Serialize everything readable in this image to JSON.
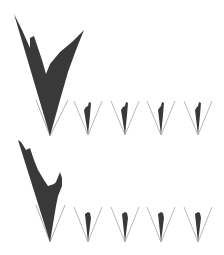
{
  "figure": {
    "background": "#ffffff",
    "fill_color": "#2e2e2e",
    "guide_color": "#9a9a9a",
    "rows": [
      {
        "name": "row-1",
        "large_wedge": {
          "apex": [
            50,
            136
          ],
          "guides": [
            [
              36,
              100
            ],
            [
              68,
              100
            ]
          ],
          "shape": "M50,136 L14,14 L22,30 L30,48 L30,38 L34,36 L42,60 L46,74 L50,64 L60,52 L72,42 L84,30 L76,50 L68,72 L60,100 Z"
        },
        "small_wedges": [
          {
            "apex": [
              88,
              135
            ],
            "guides": [
              [
                74,
                101
              ],
              [
                102,
                101
              ]
            ],
            "shape": "M88,135 L84,110 L86,107 L88,106 L89,102 L91,103 L90,115 Z"
          },
          {
            "apex": [
              125,
              135
            ],
            "guides": [
              [
                111,
                101
              ],
              [
                139,
                101
              ]
            ],
            "shape": "M125,135 L121,110 L123,107 L125,106 L126,102 L128,103 L127,115 Z"
          },
          {
            "apex": [
              161,
              135
            ],
            "guides": [
              [
                147,
                101
              ],
              [
                175,
                101
              ]
            ],
            "shape": "M161,135 L158,110 L160,107 L161,106 L162,102 L164,103 L163,115 Z"
          },
          {
            "apex": [
              198,
              135
            ],
            "guides": [
              [
                184,
                101
              ],
              [
                212,
                101
              ]
            ],
            "shape": "M198,135 L195,110 L197,107 L198,106 L199,102 L201,103 L200,115 Z"
          }
        ]
      },
      {
        "name": "row-2",
        "large_wedge": {
          "apex": [
            50,
            242
          ],
          "guides": [
            [
              36,
              205
            ],
            [
              65,
              205
            ]
          ],
          "shape": "M50,242 L18,140 L21,142 L26,150 L30,148 L34,160 L38,170 L44,180 L48,186 L54,184 L56,182 L60,172 L62,178 L62,186 L58,196 L56,206 Z"
        },
        "small_wedges": [
          {
            "apex": [
              88,
              242
            ],
            "guides": [
              [
                74,
                207
              ],
              [
                102,
                207
              ]
            ],
            "shape": "M88,242 L85,214 L88,212 L90,213 L91,218 Z"
          },
          {
            "apex": [
              125,
              242
            ],
            "guides": [
              [
                111,
                207
              ],
              [
                139,
                207
              ]
            ],
            "shape": "M125,242 L122,214 L125,212 L127,213 L128,218 Z"
          },
          {
            "apex": [
              161,
              242
            ],
            "guides": [
              [
                147,
                207
              ],
              [
                175,
                207
              ]
            ],
            "shape": "M161,242 L158,214 L161,212 L163,213 L164,218 Z"
          },
          {
            "apex": [
              198,
              242
            ],
            "guides": [
              [
                184,
                207
              ],
              [
                212,
                207
              ]
            ],
            "shape": "M198,242 L195,214 L198,212 L200,213 L201,218 Z"
          }
        ]
      }
    ]
  }
}
